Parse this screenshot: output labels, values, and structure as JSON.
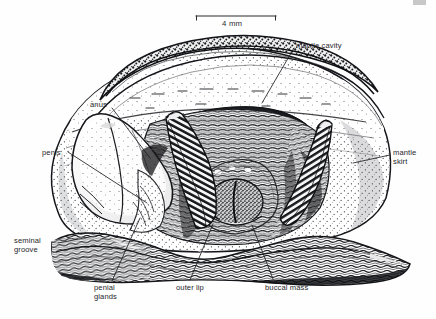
{
  "figure": {
    "kind": "scientific-anatomical-illustration",
    "background_color": "#fefefe",
    "ink_color": "#1c1d20",
    "label_color": "#25262a"
  },
  "scale_bar": {
    "label": "4 mm",
    "x_start": 196,
    "x_end": 276,
    "y": 16,
    "tick_height": 4
  },
  "labels": [
    {
      "id": "mantle-cavity",
      "text": "mantle cavity",
      "lines": [
        "mantle cavity"
      ],
      "text_x": 296,
      "text_y": 41,
      "align": "left",
      "leader": [
        [
          294,
          48
        ],
        [
          262,
          103
        ]
      ]
    },
    {
      "id": "mantle-skirt",
      "text": "mantle skirt",
      "lines": [
        "mantle",
        "skirt"
      ],
      "text_x": 393,
      "text_y": 148,
      "align": "left",
      "leader": [
        [
          390,
          155
        ],
        [
          353,
          163
        ]
      ]
    },
    {
      "id": "anus",
      "text": "anus",
      "lines": [
        "anus"
      ],
      "text_x": 90,
      "text_y": 100,
      "align": "left",
      "leader": [
        [
          112,
          108
        ],
        [
          150,
          158
        ]
      ]
    },
    {
      "id": "penis",
      "text": "penis",
      "lines": [
        "penis"
      ],
      "text_x": 42,
      "text_y": 148,
      "align": "left",
      "leader": [
        [
          68,
          152
        ],
        [
          147,
          203
        ]
      ]
    },
    {
      "id": "seminal-groove",
      "text": "seminal groove",
      "lines": [
        "seminal",
        "groove"
      ],
      "text_x": 14,
      "text_y": 236,
      "align": "left",
      "leader": [
        [
          58,
          243
        ],
        [
          105,
          234
        ]
      ]
    },
    {
      "id": "penial-glands",
      "text": "penial glands",
      "lines": [
        "penial",
        "glands"
      ],
      "text_x": 94,
      "text_y": 283,
      "align": "left",
      "leader": [
        [
          112,
          281
        ],
        [
          140,
          218
        ]
      ]
    },
    {
      "id": "outer-lip",
      "text": "outer lip",
      "lines": [
        "outer lip"
      ],
      "text_x": 176,
      "text_y": 283,
      "align": "left",
      "leader": [
        [
          190,
          280
        ],
        [
          213,
          224
        ]
      ]
    },
    {
      "id": "buccal-mass",
      "text": "buccal mass",
      "lines": [
        "buccal mass"
      ],
      "text_x": 265,
      "text_y": 283,
      "align": "left",
      "leader": [
        [
          273,
          279
        ],
        [
          252,
          225
        ]
      ]
    }
  ],
  "structures": [
    {
      "id": "shell",
      "name": "shell / mantle dome",
      "texture": "coarse-stipple-band"
    },
    {
      "id": "mantle-skirt-body",
      "name": "mantle skirt",
      "texture": "fine-stipple"
    },
    {
      "id": "mantle-cavity-opening",
      "name": "mantle cavity aperture",
      "texture": "solid-dark"
    },
    {
      "id": "left-tentacle",
      "name": "left tentacle",
      "texture": "transverse-banding"
    },
    {
      "id": "right-tentacle",
      "name": "right tentacle",
      "texture": "transverse-banding"
    },
    {
      "id": "penis-lobe",
      "name": "penis",
      "texture": "light-stipple"
    },
    {
      "id": "buccal-mass-body",
      "name": "buccal mass",
      "texture": "dense-stipple-bilobed"
    },
    {
      "id": "foot-sole",
      "name": "foot sole margin",
      "texture": "wavy-hatching"
    }
  ]
}
